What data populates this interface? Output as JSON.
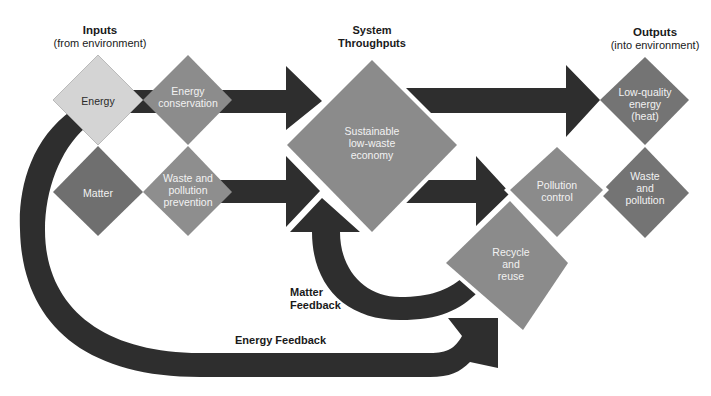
{
  "headers": {
    "inputs": {
      "title": "Inputs",
      "subtitle": "(from environment)"
    },
    "throughputs": {
      "line1": "System",
      "line2": "Throughputs"
    },
    "outputs": {
      "title": "Outputs",
      "subtitle": "(into environment)"
    }
  },
  "nodes": {
    "energy": {
      "lines": [
        "Energy"
      ],
      "color": "#d4d4d4"
    },
    "energy_conservation": {
      "lines": [
        "Energy",
        "conservation"
      ],
      "color": "#8c8c8c"
    },
    "matter": {
      "lines": [
        "Matter"
      ],
      "color": "#6f6f6f"
    },
    "waste_prevention": {
      "lines": [
        "Waste and",
        "pollution",
        "prevention"
      ],
      "color": "#8e8e8e"
    },
    "economy": {
      "lines": [
        "Sustainable",
        "low-waste",
        "economy"
      ],
      "color": "#8b8b8b"
    },
    "low_quality_energy": {
      "lines": [
        "Low-quality",
        "energy",
        "(heat)"
      ],
      "color": "#747474"
    },
    "pollution_control": {
      "lines": [
        "Pollution",
        "control"
      ],
      "color": "#8b8b8b"
    },
    "waste_pollution": {
      "lines": [
        "Waste",
        "and",
        "pollution"
      ],
      "color": "#747474"
    },
    "recycle": {
      "lines": [
        "Recycle",
        "and",
        "reuse"
      ],
      "color": "#8b8b8b"
    }
  },
  "labels": {
    "matter_feedback": {
      "line1": "Matter",
      "line2": "Feedback"
    },
    "energy_feedback": "Energy Feedback"
  },
  "colors": {
    "arrow": "#2e2e2e",
    "background": "#ffffff"
  }
}
